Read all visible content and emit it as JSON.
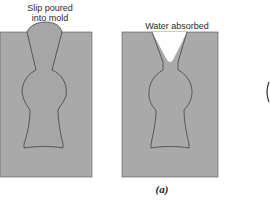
{
  "figure": {
    "panels": [
      {
        "label": "Slip poured\ninto mold",
        "label_line1": "Slip poured",
        "label_line2": "into mold"
      },
      {
        "label": "Water absorbed"
      }
    ],
    "caption": "(a)",
    "colors": {
      "mold_fill": "#a9a9a9",
      "slip_fill": "#a3a3a3",
      "outline": "#3a3a3a",
      "background": "#ffffff"
    }
  }
}
